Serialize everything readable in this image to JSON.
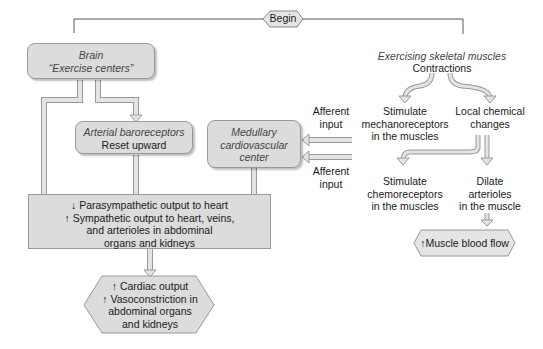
{
  "begin": {
    "label": "Begin"
  },
  "brain": {
    "title": "Brain",
    "subtitle": "“Exercise centers”"
  },
  "baroreceptors": {
    "title": "Arterial baroreceptors",
    "subtitle": "Reset upward"
  },
  "medullary": {
    "line1": "Medullary",
    "line2": "cardiovascular",
    "line3": "center"
  },
  "muscles": {
    "title": "Exercising skeletal muscles",
    "subtitle": "Contractions",
    "mechano": [
      "Stimulate",
      "mechanoreceptors",
      "in the muscles"
    ],
    "chemical": [
      "Local chemical",
      "changes"
    ],
    "chemo": [
      "Stimulate",
      "chemoreceptors",
      "in the muscles"
    ],
    "dilate": [
      "Dilate",
      "arterioles",
      "in the muscle"
    ],
    "bloodflow": "↑Muscle blood flow"
  },
  "afferent": {
    "top": [
      "Afferent",
      "input"
    ],
    "bottom": [
      "Afferent",
      "input"
    ]
  },
  "output_box": {
    "line1": "↓ Parasympathetic output to heart",
    "line2": "↑ Sympathetic output to heart, veins,",
    "line3": "and arterioles in abdominal",
    "line4": "organs and kidneys"
  },
  "result": {
    "line1": "↑ Cardiac output",
    "line2": "↑ Vasoconstriction in",
    "line3": "abdominal organs",
    "line4": "and kidneys"
  },
  "colors": {
    "box_fill": "#dcdcdc",
    "border": "#9a9a9a",
    "arrow_fill": "#e4e4e4",
    "line": "#555555"
  }
}
